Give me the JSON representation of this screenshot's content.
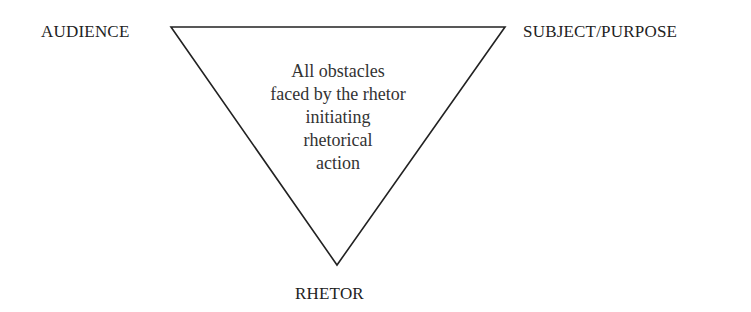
{
  "diagram": {
    "type": "inverted-triangle",
    "vertices": {
      "top_left": "AUDIENCE",
      "top_right": "SUBJECT/PURPOSE",
      "bottom": "RHETOR"
    },
    "center_text_lines": [
      "All obstacles",
      "faced by the rhetor",
      "initiating",
      "rhetorical",
      "action"
    ],
    "line_color": "#222222"
  }
}
